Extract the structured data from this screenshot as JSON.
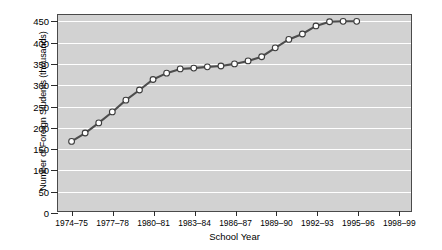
{
  "chart_data": {
    "type": "line",
    "title": "",
    "xlabel": "School Year",
    "ylabel": "Number of Foreign Students (thousands)",
    "ylim": [
      0,
      465
    ],
    "yticks": [
      0,
      50,
      100,
      150,
      200,
      250,
      300,
      350,
      400,
      450
    ],
    "ytick_labels": [
      "0",
      "50",
      "100",
      "150",
      "200",
      "250",
      "300",
      "350",
      "400",
      "450"
    ],
    "xtick_labels": [
      "1974–75",
      "1977–78",
      "1980–81",
      "1983–84",
      "1986–87",
      "1989–90",
      "1992–93",
      "1995–96",
      "1998–99"
    ],
    "xtick_years": [
      0,
      3,
      6,
      9,
      12,
      15,
      18,
      21,
      24
    ],
    "xlim": [
      -1,
      25
    ],
    "grid": "horizontal-white",
    "legend": "none",
    "marker": "open-circle",
    "line_color": "#4d4d4d",
    "marker_face": "#ffffff",
    "plot_background": "#d2d2d2",
    "categories": [
      "1974–75",
      "1975–76",
      "1976–77",
      "1977–78",
      "1978–79",
      "1979–80",
      "1980–81",
      "1981–82",
      "1982–83",
      "1983–84",
      "1984–85",
      "1985–86",
      "1986–87",
      "1987–88",
      "1988–89",
      "1989–90",
      "1990–91",
      "1991–92",
      "1992–93",
      "1993–94",
      "1994–95",
      "1995–96"
    ],
    "x": [
      0,
      1,
      2,
      3,
      4,
      5,
      6,
      7,
      8,
      9,
      10,
      11,
      12,
      13,
      14,
      15,
      16,
      17,
      18,
      19,
      20,
      21
    ],
    "values": [
      165,
      185,
      209,
      235,
      263,
      287,
      312,
      327,
      337,
      339,
      342,
      344,
      349,
      356,
      366,
      387,
      407,
      420,
      439,
      449,
      450,
      450
    ]
  }
}
